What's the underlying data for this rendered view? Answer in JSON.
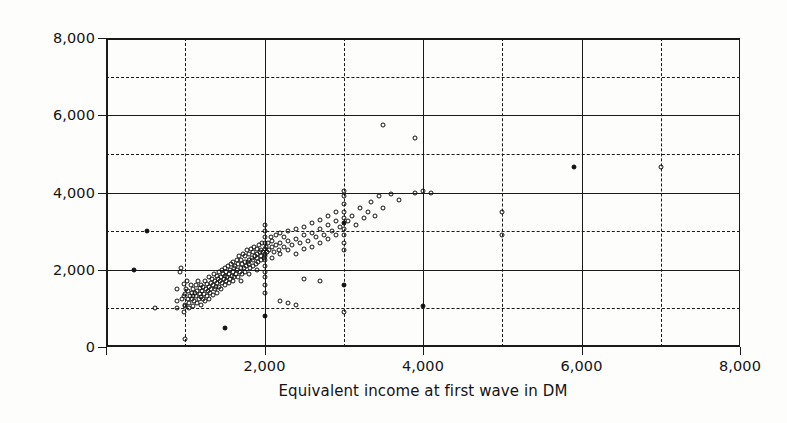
{
  "chart_data": {
    "type": "scatter",
    "title": "",
    "xlabel": "Equivalent income at first wave in DM",
    "ylabel": "Equivalent income at second wave in DM",
    "xlim": [
      0,
      8000
    ],
    "ylim": [
      0,
      8000
    ],
    "xticks": [
      0,
      2000,
      4000,
      6000,
      8000
    ],
    "yticks": [
      0,
      2000,
      4000,
      6000,
      8000
    ],
    "xtick_labels": [
      "",
      "2,000",
      "4,000",
      "6,000",
      "8,000"
    ],
    "ytick_labels": [
      "0",
      "2,000",
      "4,000",
      "6,000",
      "8,000"
    ],
    "gridlines": {
      "solid_at": [
        0,
        2000,
        4000,
        6000,
        8000
      ],
      "dashed_at": [
        1000,
        3000,
        5000,
        7000
      ],
      "both_axes": true
    },
    "legend": null,
    "marker": "open-circle",
    "marker_color": "#111111",
    "points": [
      [
        350,
        2000
      ],
      [
        520,
        3000
      ],
      [
        620,
        1020
      ],
      [
        900,
        1000
      ],
      [
        900,
        1180
      ],
      [
        900,
        1500
      ],
      [
        930,
        1950
      ],
      [
        950,
        2050
      ],
      [
        960,
        1230
      ],
      [
        980,
        1620
      ],
      [
        985,
        900
      ],
      [
        990,
        1320
      ],
      [
        1000,
        200
      ],
      [
        1000,
        1050
      ],
      [
        1000,
        1100
      ],
      [
        1000,
        1380
      ],
      [
        1010,
        1500
      ],
      [
        1020,
        1700
      ],
      [
        1030,
        1250
      ],
      [
        1040,
        1450
      ],
      [
        1050,
        1000
      ],
      [
        1050,
        1150
      ],
      [
        1060,
        1320
      ],
      [
        1070,
        1600
      ],
      [
        1080,
        1400
      ],
      [
        1090,
        1250
      ],
      [
        1100,
        1050
      ],
      [
        1100,
        1320
      ],
      [
        1100,
        1500
      ],
      [
        1110,
        1200
      ],
      [
        1120,
        1400
      ],
      [
        1130,
        1600
      ],
      [
        1140,
        1320
      ],
      [
        1150,
        1150
      ],
      [
        1150,
        1450
      ],
      [
        1160,
        1700
      ],
      [
        1170,
        1250
      ],
      [
        1180,
        1520
      ],
      [
        1190,
        1380
      ],
      [
        1200,
        1100
      ],
      [
        1200,
        1300
      ],
      [
        1200,
        1600
      ],
      [
        1210,
        1450
      ],
      [
        1220,
        1250
      ],
      [
        1230,
        1550
      ],
      [
        1240,
        1380
      ],
      [
        1250,
        1200
      ],
      [
        1250,
        1700
      ],
      [
        1260,
        1500
      ],
      [
        1270,
        1330
      ],
      [
        1280,
        1620
      ],
      [
        1290,
        1450
      ],
      [
        1300,
        1250
      ],
      [
        1300,
        1550
      ],
      [
        1300,
        1800
      ],
      [
        1310,
        1400
      ],
      [
        1320,
        1650
      ],
      [
        1330,
        1500
      ],
      [
        1340,
        1750
      ],
      [
        1350,
        1350
      ],
      [
        1350,
        1600
      ],
      [
        1360,
        1900
      ],
      [
        1370,
        1500
      ],
      [
        1380,
        1700
      ],
      [
        1390,
        1550
      ],
      [
        1400,
        1400
      ],
      [
        1400,
        1650
      ],
      [
        1400,
        1850
      ],
      [
        1410,
        1750
      ],
      [
        1420,
        1550
      ],
      [
        1430,
        1950
      ],
      [
        1440,
        1700
      ],
      [
        1450,
        1500
      ],
      [
        1450,
        1800
      ],
      [
        1460,
        2000
      ],
      [
        1470,
        1650
      ],
      [
        1480,
        1900
      ],
      [
        1490,
        1750
      ],
      [
        1500,
        500
      ],
      [
        1500,
        1600
      ],
      [
        1500,
        1850
      ],
      [
        1500,
        2050
      ],
      [
        1510,
        1700
      ],
      [
        1520,
        1950
      ],
      [
        1530,
        1800
      ],
      [
        1540,
        2100
      ],
      [
        1550,
        1650
      ],
      [
        1550,
        1900
      ],
      [
        1560,
        2000
      ],
      [
        1570,
        1750
      ],
      [
        1580,
        2150
      ],
      [
        1590,
        1850
      ],
      [
        1600,
        1700
      ],
      [
        1600,
        1950
      ],
      [
        1600,
        2200
      ],
      [
        1610,
        2050
      ],
      [
        1620,
        1800
      ],
      [
        1630,
        2100
      ],
      [
        1640,
        1900
      ],
      [
        1650,
        2250
      ],
      [
        1650,
        2000
      ],
      [
        1660,
        1800
      ],
      [
        1670,
        2150
      ],
      [
        1680,
        2350
      ],
      [
        1690,
        1950
      ],
      [
        1700,
        1700
      ],
      [
        1700,
        2050
      ],
      [
        1700,
        2250
      ],
      [
        1710,
        2150
      ],
      [
        1720,
        1900
      ],
      [
        1730,
        2400
      ],
      [
        1740,
        2050
      ],
      [
        1750,
        2200
      ],
      [
        1750,
        1950
      ],
      [
        1760,
        2350
      ],
      [
        1770,
        2100
      ],
      [
        1780,
        2500
      ],
      [
        1790,
        2200
      ],
      [
        1800,
        1900
      ],
      [
        1800,
        2150
      ],
      [
        1800,
        2400
      ],
      [
        1810,
        2250
      ],
      [
        1820,
        2050
      ],
      [
        1830,
        2550
      ],
      [
        1840,
        2300
      ],
      [
        1850,
        2100
      ],
      [
        1850,
        2450
      ],
      [
        1860,
        2250
      ],
      [
        1870,
        2600
      ],
      [
        1880,
        2350
      ],
      [
        1890,
        2150
      ],
      [
        1900,
        2000
      ],
      [
        1900,
        2300
      ],
      [
        1900,
        2550
      ],
      [
        1910,
        2400
      ],
      [
        1920,
        2200
      ],
      [
        1930,
        2650
      ],
      [
        1940,
        2450
      ],
      [
        1950,
        2250
      ],
      [
        1950,
        2500
      ],
      [
        1960,
        2350
      ],
      [
        1970,
        2700
      ],
      [
        1980,
        2450
      ],
      [
        1990,
        2300
      ],
      [
        2000,
        800
      ],
      [
        2000,
        1400
      ],
      [
        2000,
        1600
      ],
      [
        2000,
        1800
      ],
      [
        2000,
        1950
      ],
      [
        2000,
        2100
      ],
      [
        2000,
        2250
      ],
      [
        2000,
        2400
      ],
      [
        2000,
        2550
      ],
      [
        2000,
        2700
      ],
      [
        2000,
        2850
      ],
      [
        2000,
        3000
      ],
      [
        2000,
        3150
      ],
      [
        2010,
        2350
      ],
      [
        2020,
        2600
      ],
      [
        2030,
        2450
      ],
      [
        2050,
        2700
      ],
      [
        2060,
        2500
      ],
      [
        2080,
        2850
      ],
      [
        2100,
        2300
      ],
      [
        2100,
        2600
      ],
      [
        2100,
        2750
      ],
      [
        2120,
        2450
      ],
      [
        2150,
        2650
      ],
      [
        2150,
        2900
      ],
      [
        2180,
        2500
      ],
      [
        2200,
        1200
      ],
      [
        2200,
        2400
      ],
      [
        2200,
        2700
      ],
      [
        2200,
        2950
      ],
      [
        2250,
        2600
      ],
      [
        2250,
        2850
      ],
      [
        2300,
        1150
      ],
      [
        2300,
        2500
      ],
      [
        2300,
        2750
      ],
      [
        2300,
        3000
      ],
      [
        2350,
        2650
      ],
      [
        2400,
        1100
      ],
      [
        2400,
        2400
      ],
      [
        2400,
        2800
      ],
      [
        2400,
        3050
      ],
      [
        2450,
        2700
      ],
      [
        2500,
        1750
      ],
      [
        2500,
        2550
      ],
      [
        2500,
        2900
      ],
      [
        2500,
        3100
      ],
      [
        2550,
        2750
      ],
      [
        2600,
        2600
      ],
      [
        2600,
        2950
      ],
      [
        2600,
        3200
      ],
      [
        2650,
        2850
      ],
      [
        2700,
        1700
      ],
      [
        2700,
        2700
      ],
      [
        2700,
        3050
      ],
      [
        2700,
        3300
      ],
      [
        2750,
        2900
      ],
      [
        2800,
        2800
      ],
      [
        2800,
        3150
      ],
      [
        2800,
        3400
      ],
      [
        2850,
        3000
      ],
      [
        2900,
        2900
      ],
      [
        2900,
        3250
      ],
      [
        2900,
        3500
      ],
      [
        2950,
        3100
      ],
      [
        3000,
        900
      ],
      [
        3000,
        1600
      ],
      [
        3000,
        2500
      ],
      [
        3000,
        2700
      ],
      [
        3000,
        2900
      ],
      [
        3000,
        3050
      ],
      [
        3000,
        3200
      ],
      [
        3000,
        3350
      ],
      [
        3000,
        3500
      ],
      [
        3000,
        3700
      ],
      [
        3000,
        3900
      ],
      [
        3000,
        4050
      ],
      [
        3050,
        3250
      ],
      [
        3100,
        3400
      ],
      [
        3150,
        3150
      ],
      [
        3200,
        3600
      ],
      [
        3250,
        3350
      ],
      [
        3300,
        3500
      ],
      [
        3350,
        3750
      ],
      [
        3400,
        3400
      ],
      [
        3450,
        3900
      ],
      [
        3500,
        3600
      ],
      [
        3500,
        5750
      ],
      [
        3600,
        3950
      ],
      [
        3700,
        3800
      ],
      [
        3900,
        4000
      ],
      [
        3900,
        5400
      ],
      [
        4000,
        4050
      ],
      [
        4100,
        4000
      ],
      [
        4000,
        1050
      ],
      [
        5000,
        2900
      ],
      [
        5000,
        3500
      ],
      [
        5900,
        4650
      ],
      [
        7000,
        4650
      ]
    ],
    "filled_points": [
      [
        520,
        3000
      ],
      [
        350,
        2000
      ],
      [
        1000,
        1950
      ],
      [
        1020,
        1900
      ],
      [
        1500,
        500
      ],
      [
        2000,
        800
      ],
      [
        2400,
        2650
      ],
      [
        2700,
        2900
      ],
      [
        2900,
        3050
      ],
      [
        3000,
        3200
      ],
      [
        3000,
        1600
      ],
      [
        4000,
        1050
      ],
      [
        4100,
        4050
      ],
      [
        5900,
        4650
      ],
      [
        1220,
        2050
      ],
      [
        1240,
        2000
      ],
      [
        2050,
        2250
      ],
      [
        2150,
        2200
      ],
      [
        2900,
        3150
      ],
      [
        3000,
        3800
      ]
    ]
  },
  "axes": {
    "x_title": "Equivalent income at first wave in DM",
    "y_title": "Equivalent income at second wave in DM",
    "x_ticks": [
      {
        "value": 0,
        "label": ""
      },
      {
        "value": 2000,
        "label": "2,000"
      },
      {
        "value": 4000,
        "label": "4,000"
      },
      {
        "value": 6000,
        "label": "6,000"
      },
      {
        "value": 8000,
        "label": "8,000"
      }
    ],
    "y_ticks": [
      {
        "value": 0,
        "label": "0"
      },
      {
        "value": 2000,
        "label": "2,000"
      },
      {
        "value": 4000,
        "label": "4,000"
      },
      {
        "value": 6000,
        "label": "6,000"
      },
      {
        "value": 8000,
        "label": "8,000"
      }
    ]
  },
  "style": {
    "ink": "#111111",
    "background": "#fdfdfb"
  }
}
